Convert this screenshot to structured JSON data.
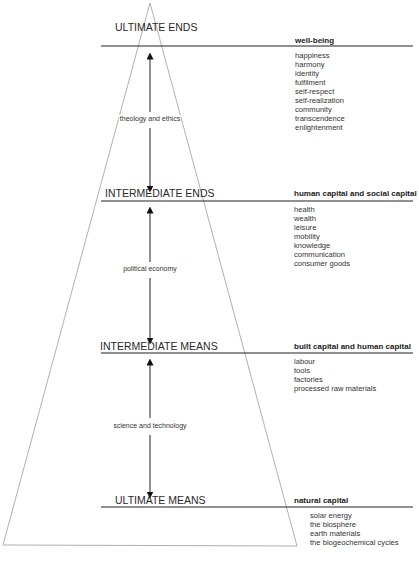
{
  "levels": [
    {
      "title": "ULTIMATE ENDS",
      "category": "well-being",
      "items": [
        "happiness",
        "harmony",
        "identity",
        "fulfilment",
        "self-respect",
        "self-realization",
        "community",
        "transcendence",
        "enlightenment"
      ]
    },
    {
      "title": "INTERMEDIATE ENDS",
      "category": "human capital and social capital",
      "items": [
        "health",
        "wealth",
        "leisure",
        "mobility",
        "knowledge",
        "communication",
        "consumer goods"
      ]
    },
    {
      "title": "INTERMEDIATE MEANS",
      "category": "built capital and human capital",
      "items": [
        "labour",
        "tools",
        "factories",
        "processed raw materials"
      ]
    },
    {
      "title": "ULTIMATE MEANS",
      "category": "natural capital",
      "items": [
        "solar energy",
        "the biosphere",
        "earth materials",
        "the biogeochemical cycles"
      ]
    }
  ],
  "arrows": [
    {
      "label": "theology and ethics"
    },
    {
      "label": "political economy"
    },
    {
      "label": "science and technology"
    }
  ],
  "colors": {
    "line": "#222222",
    "triangle": "#9a9a9a",
    "text": "#222222"
  }
}
